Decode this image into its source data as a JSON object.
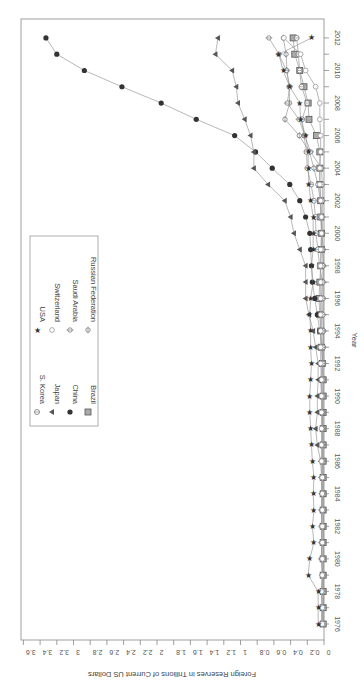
{
  "chart_data": {
    "type": "line",
    "orientation": "rotated-90-clockwise",
    "title": "",
    "xlabel": "Year",
    "ylabel": "Foreign Reserves in Trillions of Current US Dollars",
    "x_ticks": [
      "1976",
      "1978",
      "1980",
      "1982",
      "1984",
      "1986",
      "1988",
      "1990",
      "1992",
      "1994",
      "1996",
      "1998",
      "2000",
      "2002",
      "2004",
      "2006",
      "2008",
      "2010",
      "2012"
    ],
    "y_ticks": [
      "0",
      "0.2",
      "0.4",
      "0.6",
      "0.8",
      "1",
      "1.2",
      "1.4",
      "1.6",
      "1.8",
      "2",
      "2.2",
      "2.4",
      "2.6",
      "2.8",
      "3",
      "3.2",
      "3.4",
      "3.6"
    ],
    "ylim": [
      0,
      3.6
    ],
    "xlim": [
      1976,
      2012
    ],
    "grid": false,
    "legend_position": "upper-left (inside plot)",
    "x": [
      1976,
      1977,
      1978,
      1979,
      1980,
      1981,
      1982,
      1983,
      1984,
      1985,
      1986,
      1987,
      1988,
      1989,
      1990,
      1991,
      1992,
      1993,
      1994,
      1995,
      1996,
      1997,
      1998,
      1999,
      2000,
      2001,
      2002,
      2003,
      2004,
      2005,
      2006,
      2007,
      2008,
      2009,
      2010,
      2011,
      2012
    ],
    "series": [
      {
        "name": "Brazil",
        "marker": "square",
        "values": [
          0.01,
          0.01,
          0.01,
          0.01,
          0.01,
          0.01,
          0.01,
          0.01,
          0.01,
          0.01,
          0.01,
          0.01,
          0.01,
          0.01,
          0.01,
          0.01,
          0.02,
          0.03,
          0.04,
          0.05,
          0.06,
          0.05,
          0.04,
          0.03,
          0.03,
          0.04,
          0.04,
          0.05,
          0.05,
          0.05,
          0.09,
          0.18,
          0.19,
          0.24,
          0.29,
          0.35,
          0.37
        ]
      },
      {
        "name": "China",
        "marker": "filled-circle",
        "values": [
          0.01,
          0.01,
          0.01,
          0.01,
          0.01,
          0.01,
          0.01,
          0.01,
          0.02,
          0.02,
          0.02,
          0.02,
          0.02,
          0.02,
          0.03,
          0.04,
          0.02,
          0.02,
          0.05,
          0.08,
          0.11,
          0.14,
          0.15,
          0.16,
          0.17,
          0.22,
          0.29,
          0.41,
          0.62,
          0.82,
          1.07,
          1.53,
          1.95,
          2.42,
          2.87,
          3.2,
          3.33
        ]
      },
      {
        "name": "Japan",
        "marker": "triangle",
        "values": [
          0.02,
          0.02,
          0.03,
          0.02,
          0.03,
          0.03,
          0.03,
          0.03,
          0.03,
          0.03,
          0.04,
          0.08,
          0.1,
          0.08,
          0.08,
          0.07,
          0.07,
          0.1,
          0.13,
          0.18,
          0.22,
          0.22,
          0.22,
          0.29,
          0.36,
          0.4,
          0.47,
          0.67,
          0.84,
          0.84,
          0.88,
          0.95,
          1.03,
          1.05,
          1.1,
          1.3,
          1.27
        ]
      },
      {
        "name": "S. Korea",
        "marker": "open-circle-cross",
        "values": [
          0.003,
          0.004,
          0.005,
          0.006,
          0.007,
          0.007,
          0.007,
          0.007,
          0.008,
          0.008,
          0.008,
          0.009,
          0.012,
          0.015,
          0.015,
          0.014,
          0.017,
          0.02,
          0.025,
          0.033,
          0.034,
          0.02,
          0.052,
          0.074,
          0.096,
          0.103,
          0.121,
          0.155,
          0.199,
          0.21,
          0.239,
          0.262,
          0.201,
          0.27,
          0.292,
          0.306,
          0.327
        ]
      },
      {
        "name": "Russian Federation",
        "marker": "open-circle-plus",
        "values": [
          null,
          null,
          null,
          null,
          null,
          null,
          null,
          null,
          null,
          null,
          null,
          null,
          null,
          null,
          null,
          null,
          0.002,
          0.006,
          0.004,
          0.017,
          0.011,
          0.013,
          0.008,
          0.009,
          0.024,
          0.033,
          0.044,
          0.073,
          0.121,
          0.176,
          0.296,
          0.467,
          0.412,
          0.417,
          0.444,
          0.454,
          0.487
        ]
      },
      {
        "name": "Saudi Arabia",
        "marker": "open-circle-plus-tick",
        "values": [
          0.03,
          0.03,
          0.02,
          0.02,
          0.03,
          0.03,
          0.03,
          0.03,
          0.02,
          0.03,
          0.02,
          0.02,
          0.02,
          0.02,
          0.01,
          0.01,
          0.01,
          0.01,
          0.01,
          0.01,
          0.01,
          0.01,
          0.01,
          0.02,
          0.02,
          0.02,
          0.02,
          0.02,
          0.03,
          0.16,
          0.23,
          0.3,
          0.44,
          0.41,
          0.45,
          0.54,
          0.66
        ]
      },
      {
        "name": "Switzerland",
        "marker": "open-diamond-circle",
        "values": [
          0.02,
          0.02,
          0.03,
          0.02,
          0.02,
          0.02,
          0.02,
          0.02,
          0.02,
          0.02,
          0.03,
          0.03,
          0.03,
          0.03,
          0.03,
          0.03,
          0.04,
          0.04,
          0.04,
          0.04,
          0.04,
          0.04,
          0.04,
          0.04,
          0.03,
          0.03,
          0.04,
          0.05,
          0.05,
          0.04,
          0.04,
          0.05,
          0.05,
          0.1,
          0.22,
          0.28,
          0.48
        ]
      },
      {
        "name": "USA",
        "marker": "star",
        "values": [
          0.07,
          0.07,
          0.07,
          0.19,
          0.17,
          0.12,
          0.14,
          0.12,
          0.13,
          0.12,
          0.14,
          0.15,
          0.16,
          0.17,
          0.17,
          0.16,
          0.15,
          0.16,
          0.16,
          0.17,
          0.16,
          0.13,
          0.15,
          0.13,
          0.13,
          0.13,
          0.16,
          0.18,
          0.19,
          0.19,
          0.22,
          0.28,
          0.29,
          0.41,
          0.49,
          0.54,
          0.15
        ]
      }
    ]
  },
  "legend": {
    "items": [
      {
        "label": "Brazil",
        "marker": "square"
      },
      {
        "label": "China",
        "marker": "filled-circle"
      },
      {
        "label": "Japan",
        "marker": "triangle"
      },
      {
        "label": "S. Korea",
        "marker": "open-circle-cross"
      },
      {
        "label": "Russian Federation",
        "marker": "open-circle-plus"
      },
      {
        "label": "Saudi Arabia",
        "marker": "open-circle-plus-tick"
      },
      {
        "label": "Switzerland",
        "marker": "open-diamond-circle"
      },
      {
        "label": "USA",
        "marker": "star"
      }
    ]
  },
  "colors": {
    "axis": "#888888",
    "line": "#9a9a9a",
    "marker_dark": "#333333",
    "marker_mid": "#777777",
    "legend_border": "#999999"
  }
}
